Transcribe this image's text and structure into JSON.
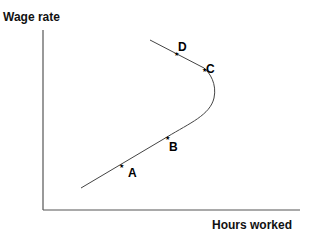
{
  "diagram": {
    "y_axis_label": "Wage rate",
    "x_axis_label": "Hours worked",
    "points": [
      {
        "label": "A"
      },
      {
        "label": "B"
      },
      {
        "label": "C"
      },
      {
        "label": "D"
      }
    ],
    "colors": {
      "line": "#333333",
      "text": "#111111",
      "background": "#ffffff"
    }
  }
}
